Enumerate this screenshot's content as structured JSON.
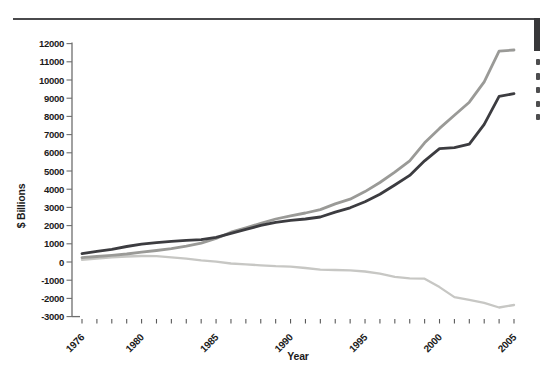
{
  "page": {
    "background": "#ffffff",
    "top_rule_color": "#4a4a4c",
    "page_edge_bar_color": "#38383a",
    "cropped_text_note": "unreadable letter fragments cut off at right image edge"
  },
  "chart_data": {
    "type": "line",
    "title": "",
    "xlabel": "Year",
    "ylabel": "$ Billions",
    "x_range": [
      1976,
      2005
    ],
    "ylim": [
      -3000,
      12000
    ],
    "ytick_step": 1000,
    "grid": false,
    "legend_position": "cut off at right edge of image",
    "x": [
      1976,
      1977,
      1978,
      1979,
      1980,
      1981,
      1982,
      1983,
      1984,
      1985,
      1986,
      1987,
      1988,
      1989,
      1990,
      1991,
      1992,
      1993,
      1994,
      1995,
      1996,
      1997,
      1998,
      1999,
      2000,
      2001,
      2002,
      2003,
      2004,
      2005
    ],
    "xtick_values": [
      1976,
      1980,
      1985,
      1990,
      1995,
      2000,
      2005
    ],
    "xtick_labels": [
      "1976",
      "1980",
      "1985",
      "1990",
      "1995",
      "2000",
      "2005"
    ],
    "ytick_values": [
      12000,
      11000,
      10000,
      9000,
      8000,
      7000,
      6000,
      5000,
      4000,
      3000,
      2000,
      1000,
      0,
      -1000,
      -2000,
      -3000
    ],
    "ytick_labels": [
      "12000",
      "11000",
      "10000",
      "9000",
      "8000",
      "7000",
      "6000",
      "5000",
      "4000",
      "3000",
      "2000",
      "1000",
      "0",
      "-1000",
      "-2000",
      "-3000"
    ],
    "series": [
      {
        "name": "medium-gray-line",
        "color": "#9a9a97",
        "stroke_width": 2.8,
        "values": [
          240,
          300,
          370,
          440,
          540,
          630,
          730,
          870,
          1040,
          1290,
          1640,
          1880,
          2120,
          2360,
          2540,
          2690,
          2880,
          3190,
          3450,
          3870,
          4370,
          4940,
          5560,
          6550,
          7340,
          8060,
          8780,
          9900,
          11590,
          11650
        ]
      },
      {
        "name": "dark-gray-line",
        "color": "#3c3c40",
        "stroke_width": 2.8,
        "values": [
          460,
          580,
          700,
          850,
          980,
          1060,
          1130,
          1190,
          1230,
          1350,
          1570,
          1790,
          2010,
          2180,
          2290,
          2360,
          2470,
          2740,
          2980,
          3310,
          3720,
          4230,
          4760,
          5560,
          6230,
          6280,
          6480,
          7560,
          9100,
          9250
        ]
      },
      {
        "name": "light-gray-line",
        "color": "#c7c7c4",
        "stroke_width": 2.3,
        "values": [
          120,
          180,
          250,
          300,
          330,
          320,
          250,
          180,
          90,
          20,
          -80,
          -130,
          -180,
          -230,
          -260,
          -330,
          -420,
          -440,
          -460,
          -520,
          -640,
          -820,
          -900,
          -920,
          -1380,
          -1930,
          -2080,
          -2250,
          -2500,
          -2360
        ]
      }
    ]
  }
}
